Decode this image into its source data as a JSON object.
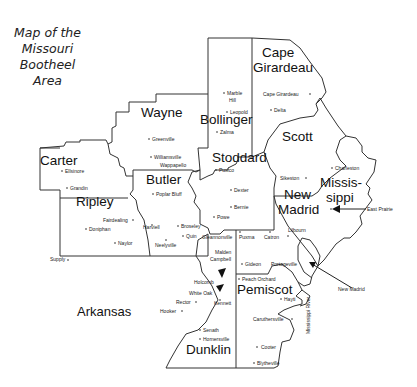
{
  "title": {
    "lines": [
      "Map of the",
      "Missouri",
      "Bootheel",
      "Area"
    ]
  },
  "counties": [
    {
      "name": "Cape Girardeau",
      "lines": [
        "Cape",
        "Girardeau"
      ]
    },
    {
      "name": "Wayne",
      "lines": [
        "Wayne"
      ]
    },
    {
      "name": "Bollinger",
      "lines": [
        "Bollinger"
      ]
    },
    {
      "name": "Scott",
      "lines": [
        "Scott"
      ]
    },
    {
      "name": "Carter",
      "lines": [
        "Carter"
      ]
    },
    {
      "name": "Stoddard",
      "lines": [
        "Stoddard"
      ]
    },
    {
      "name": "Butler",
      "lines": [
        "Butler"
      ]
    },
    {
      "name": "Mississippi",
      "lines": [
        "Missis-",
        "sippi"
      ]
    },
    {
      "name": "Ripley",
      "lines": [
        "Ripley"
      ]
    },
    {
      "name": "New Madrid",
      "lines": [
        "New",
        "Madrid"
      ]
    },
    {
      "name": "Pemiscot",
      "lines": [
        "Pemiscot"
      ]
    },
    {
      "name": "Dunklin",
      "lines": [
        "Dunklin"
      ]
    }
  ],
  "regions": {
    "arkansas": "Arkansas",
    "river": "Mississippi River"
  },
  "towns": {
    "marble_hill_1": "Marble",
    "marble_hill_2": "Hill",
    "leopold": "Leopold",
    "zalma": "Zalma",
    "cape_girardeau": "Cape Girardeau",
    "delta": "Delta",
    "greenville": "Greenville",
    "williamsville": "Williamsville",
    "wappapello": "Wappapello",
    "ellsinore": "Ellsinore",
    "grandin": "Grandin",
    "puxico": "Puxico",
    "dexter": "Dexter",
    "bernie": "Bernie",
    "poplar_bluff": "Poplar Bluff",
    "charleston": "Charleston",
    "sikeston": "Sikeston",
    "east_prairie": "East Prairie",
    "fairdealing": "Fairdealing",
    "doniphan": "Doniphan",
    "naylor": "Naylor",
    "harviell": "Harviell",
    "broseley": "Broseley",
    "quin": "Quin",
    "neelyville": "Neelyville",
    "powe": "Powe",
    "gleannonville": "Gleannonville",
    "puxma": "Puxma",
    "catron": "Catron",
    "lilbourn": "Lilbourn",
    "new_madrid": "New Madrid",
    "supply": "Supply",
    "malden": "Malden",
    "campbell": "Campbell",
    "gideon": "Gideon",
    "portageville": "Portageville",
    "peach_orchard": "Peach Orchard",
    "holcomb": "Holcomb",
    "white_oak": "White Oak",
    "kennett": "Kennett",
    "rector": "Rector",
    "hooker": "Hooker",
    "hayti": "Hayti",
    "caruthersville": "Caruthersville",
    "senath": "Senath",
    "hornersville": "Hornersville",
    "cooter": "Cooter",
    "blytheville": "Blytheville"
  }
}
